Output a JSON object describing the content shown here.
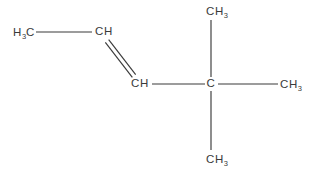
{
  "diagram": {
    "background_color": "#ffffff",
    "stroke_color": "#3a3a3a",
    "text_color": "#3a3a3a",
    "atoms": [
      {
        "id": "methyl-terminal",
        "formula": "H3C",
        "text_main": "C",
        "prefix": "H",
        "prefix_sub": "3",
        "x": 24,
        "y": 33
      },
      {
        "id": "alkene-carbon-upper",
        "formula": "CH",
        "x": 104,
        "y": 32,
        "sub": ""
      },
      {
        "id": "alkene-carbon-lower",
        "formula": "CH",
        "x": 140,
        "y": 84,
        "sub": ""
      },
      {
        "id": "quaternary-carbon",
        "formula": "C",
        "x": 211,
        "y": 84,
        "sub": ""
      },
      {
        "id": "methyl-top",
        "formula": "CH",
        "sub": "3",
        "x": 217,
        "y": 12
      },
      {
        "id": "methyl-right",
        "formula": "CH",
        "sub": "3",
        "x": 291,
        "y": 85
      },
      {
        "id": "methyl-bottom",
        "formula": "CH",
        "sub": "3",
        "x": 217,
        "y": 160
      }
    ],
    "bonds": [
      {
        "id": "bond-methyl-to-alkene",
        "type": "single",
        "order": 1,
        "x1": 36,
        "y1": 32,
        "x2": 92,
        "y2": 32
      },
      {
        "id": "bond-double-alkene",
        "type": "double",
        "order": 2,
        "x1": 107,
        "y1": 41,
        "x2": 134,
        "y2": 76
      },
      {
        "id": "bond-alkene-to-quaternary",
        "type": "single",
        "order": 1,
        "x1": 152,
        "y1": 84,
        "x2": 205,
        "y2": 84
      },
      {
        "id": "bond-quaternary-to-methyl-top",
        "type": "single",
        "order": 1,
        "x1": 211,
        "y1": 20,
        "x2": 211,
        "y2": 77
      },
      {
        "id": "bond-quaternary-to-methyl-right",
        "type": "single",
        "order": 1,
        "x1": 218,
        "y1": 84,
        "x2": 278,
        "y2": 84
      },
      {
        "id": "bond-quaternary-to-methyl-bottom",
        "type": "single",
        "order": 1,
        "x1": 211,
        "y1": 91,
        "x2": 211,
        "y2": 150
      }
    ]
  }
}
